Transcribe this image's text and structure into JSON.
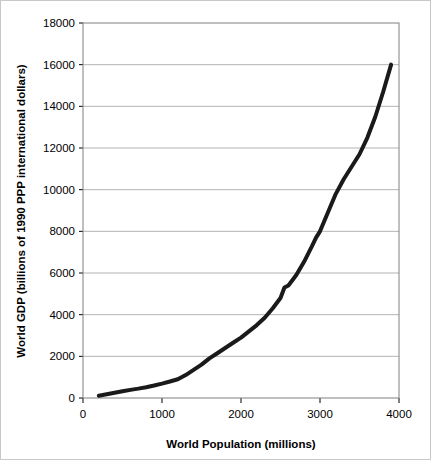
{
  "chart_data": {
    "type": "line",
    "title": "",
    "subtitle": "",
    "xlabel": "World Population (millions)",
    "ylabel": "World GDP (billions of 1990 PPP international dollars)",
    "xlim": [
      0,
      4000
    ],
    "ylim": [
      0,
      18000
    ],
    "xticks": [
      "0",
      "1000",
      "2000",
      "3000",
      "4000"
    ],
    "xtick_values": [
      0,
      1000,
      2000,
      3000,
      4000
    ],
    "yticks": [
      "0",
      "2000",
      "4000",
      "6000",
      "8000",
      "10000",
      "12000",
      "14000",
      "16000",
      "18000"
    ],
    "ytick_values": [
      0,
      2000,
      4000,
      6000,
      8000,
      10000,
      12000,
      14000,
      16000,
      18000
    ],
    "grid": "horizontal",
    "legend": "none",
    "line_color": "#1a1a1a",
    "line_width": 4,
    "plot_border_color": "#808080",
    "grid_color": "#a0a0a0",
    "background": "#ffffff",
    "series": [
      {
        "name": "World GDP vs World Population",
        "x": [
          200,
          300,
          400,
          500,
          600,
          700,
          800,
          900,
          1000,
          1100,
          1200,
          1300,
          1400,
          1500,
          1600,
          1700,
          1800,
          1900,
          2000,
          2100,
          2200,
          2300,
          2400,
          2500,
          2550,
          2600,
          2700,
          2800,
          2900,
          2950,
          3000,
          3100,
          3200,
          3300,
          3400,
          3500,
          3600,
          3700,
          3800,
          3900
        ],
        "y": [
          110,
          180,
          250,
          320,
          390,
          450,
          520,
          600,
          690,
          790,
          900,
          1100,
          1350,
          1600,
          1900,
          2150,
          2400,
          2650,
          2900,
          3200,
          3500,
          3850,
          4300,
          4800,
          5300,
          5400,
          5900,
          6550,
          7300,
          7700,
          8000,
          8900,
          9800,
          10500,
          11100,
          11700,
          12500,
          13500,
          14700,
          16000
        ]
      }
    ]
  },
  "axes": {
    "x_axis_name": "World Population (millions)",
    "y_axis_name": "World GDP (billions of 1990 PPP international dollars)"
  }
}
